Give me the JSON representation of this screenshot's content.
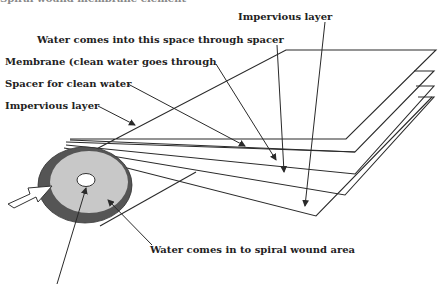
{
  "figure": {
    "title_partial": "Spiral wound membrane element",
    "colors": {
      "line": "#2a2a2a",
      "outer_ring": "#555555",
      "core_fill": "#c8c8c8",
      "center_hole": "#ffffff",
      "background": "#ffffff"
    }
  },
  "labels": {
    "impervious_top": "Impervious layer",
    "water_spacer": "Water comes into this space through spacer",
    "membrane": "Membrane (clean water goes through",
    "spacer_clean": "Spacer for clean water",
    "impervious_left": "Impervious layer",
    "water_spiral": "Water comes in to spiral wound area"
  }
}
